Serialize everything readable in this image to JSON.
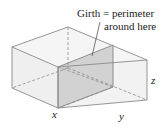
{
  "figure": {
    "annotation": {
      "line1": "Girth = perimeter",
      "line2": "around here"
    },
    "labels": {
      "x": "x",
      "y": "y",
      "z": "z"
    },
    "colors": {
      "box_face": "#f3f3f3",
      "box_edge": "#8a8a8a",
      "girth_panel": "#cfcfcf",
      "text": "#222222"
    }
  }
}
